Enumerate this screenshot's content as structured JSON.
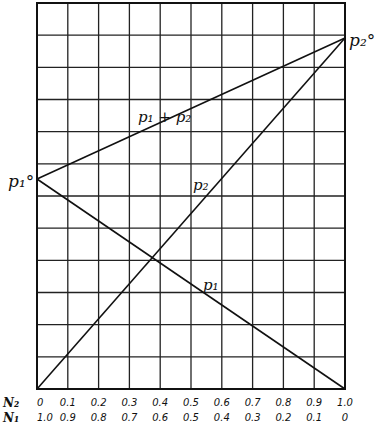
{
  "figure": {
    "type": "vapor-pressure-composition diagram (ideal solution, Raoult's law)",
    "grid": {
      "columns": 10,
      "rows": 12
    },
    "labels": {
      "p1_pure": "p₁°",
      "p2_pure": "p₂°",
      "total": "p₁ + p₂",
      "p2_line": "p₂",
      "p1_line": "p₁"
    },
    "axis": {
      "n2_name": "N₂",
      "n1_name": "N₁",
      "n2_ticks": [
        "0",
        "0.1",
        "0.2",
        "0.3",
        "0.4",
        "0.5",
        "0.6",
        "0.7",
        "0.8",
        "0.9",
        "1.0"
      ],
      "n1_ticks": [
        "1.0",
        "0.9",
        "0.8",
        "0.7",
        "0.6",
        "0.5",
        "0.4",
        "0.3",
        "0.2",
        "0.1",
        "0"
      ]
    },
    "lines": [
      {
        "name": "p1",
        "from": {
          "N2": 0,
          "grid_y": 6.5
        },
        "to": {
          "N2": 1.0,
          "grid_y": 0
        }
      },
      {
        "name": "p2",
        "from": {
          "N2": 0,
          "grid_y": 0
        },
        "to": {
          "N2": 1.0,
          "grid_y": 11
        }
      },
      {
        "name": "p1_plus_p2",
        "from": {
          "N2": 0,
          "grid_y": 6.5
        },
        "to": {
          "N2": 1.0,
          "grid_y": 11
        }
      }
    ]
  }
}
